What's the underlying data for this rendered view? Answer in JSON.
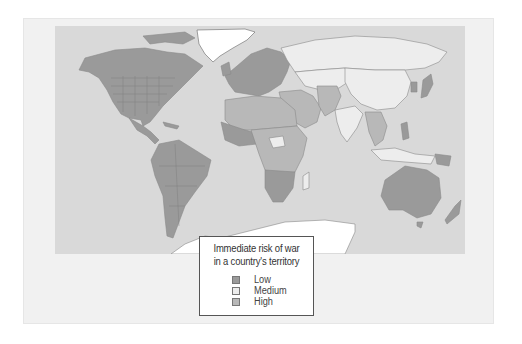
{
  "figure": {
    "frame_color": "#f1f1f1",
    "ocean_color": "#d9d9d9",
    "ice_color": "#ffffff",
    "border_color": "#8a8a8a"
  },
  "legend": {
    "title_line1": "Immediate risk of war",
    "title_line2": "in a country's territory",
    "items": [
      {
        "label": "Low",
        "color": "#9a9a9a"
      },
      {
        "label": "Medium",
        "color": "#ededed"
      },
      {
        "label": "High",
        "color": "#b8b8b8"
      }
    ]
  },
  "regions": [
    {
      "name": "North America",
      "risk": "Low"
    },
    {
      "name": "Central America",
      "risk": "Low"
    },
    {
      "name": "South America",
      "risk": "Low"
    },
    {
      "name": "Western Europe",
      "risk": "Low"
    },
    {
      "name": "Russia",
      "risk": "Medium"
    },
    {
      "name": "Central Asia",
      "risk": "Medium"
    },
    {
      "name": "China",
      "risk": "Medium"
    },
    {
      "name": "India",
      "risk": "Medium"
    },
    {
      "name": "Pakistan / Afghanistan",
      "risk": "High"
    },
    {
      "name": "Middle East",
      "risk": "High"
    },
    {
      "name": "North Africa",
      "risk": "High"
    },
    {
      "name": "Sub-Saharan Africa",
      "risk": "High"
    },
    {
      "name": "Southern Africa",
      "risk": "Low"
    },
    {
      "name": "Southeast Asia",
      "risk": "High"
    },
    {
      "name": "Japan",
      "risk": "Low"
    },
    {
      "name": "Korea",
      "risk": "Low"
    },
    {
      "name": "Philippines",
      "risk": "Low"
    },
    {
      "name": "Indonesia",
      "risk": "Medium"
    },
    {
      "name": "Australia",
      "risk": "Low"
    },
    {
      "name": "New Zealand",
      "risk": "Low"
    },
    {
      "name": "Greenland",
      "risk": "none"
    },
    {
      "name": "Antarctica",
      "risk": "none"
    }
  ]
}
